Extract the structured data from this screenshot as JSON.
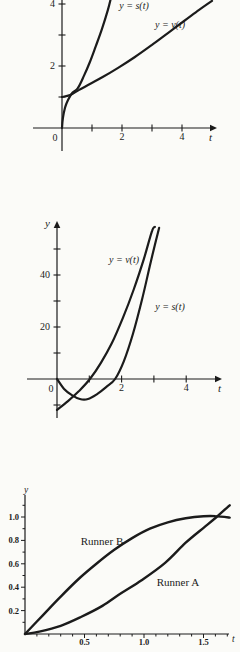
{
  "page": {
    "background": "#fbfbf8",
    "ink_color": "#1b1b1b"
  },
  "chart_data": [
    {
      "id": "top-position-velocity",
      "type": "line",
      "title": "",
      "xlabel": "t",
      "ylabel": "",
      "origin_label": "0",
      "xlim": [
        0,
        5.2
      ],
      "ylim": [
        0,
        4.3
      ],
      "grid": false,
      "legend_position": "inline-annotations",
      "x_ticks": [
        {
          "v": 1,
          "label": ""
        },
        {
          "v": 2,
          "label": "2"
        },
        {
          "v": 3,
          "label": ""
        },
        {
          "v": 4,
          "label": "4"
        }
      ],
      "y_ticks": [
        {
          "v": 1,
          "label": ""
        },
        {
          "v": 2,
          "label": "2"
        },
        {
          "v": 3,
          "label": ""
        },
        {
          "v": 4,
          "label": "4"
        }
      ],
      "series": [
        {
          "name": "y = s(t)",
          "points": [
            [
              0,
              0
            ],
            [
              0.03,
              0.32
            ],
            [
              0.1,
              0.65
            ],
            [
              0.2,
              0.9
            ],
            [
              0.34,
              1.13
            ],
            [
              0.53,
              1.29
            ],
            [
              0.73,
              1.68
            ],
            [
              0.93,
              2.13
            ],
            [
              1.13,
              2.65
            ],
            [
              1.33,
              3.19
            ],
            [
              1.53,
              3.81
            ],
            [
              1.63,
              4.19
            ]
          ]
        },
        {
          "name": "y = v(t)",
          "points": [
            [
              0,
              1.0
            ],
            [
              0.27,
              1.06
            ],
            [
              0.57,
              1.23
            ],
            [
              0.93,
              1.42
            ],
            [
              1.37,
              1.65
            ],
            [
              1.87,
              1.94
            ],
            [
              2.43,
              2.29
            ],
            [
              3.0,
              2.68
            ],
            [
              3.53,
              3.06
            ],
            [
              4.07,
              3.45
            ],
            [
              4.57,
              3.81
            ],
            [
              5.0,
              4.1
            ]
          ]
        }
      ],
      "annotations": [
        {
          "text": "y = s(t)",
          "x": 134,
          "y": 9,
          "italic": true,
          "fs": 10
        },
        {
          "text": "y = v(t)",
          "x": 170,
          "y": 28,
          "italic": true,
          "fs": 10
        }
      ]
    },
    {
      "id": "middle-position-velocity",
      "type": "line",
      "title": "",
      "xlabel": "t",
      "ylabel": "y",
      "origin_label": "0",
      "xlim": [
        0,
        5.0
      ],
      "ylim": [
        -15,
        62
      ],
      "grid": false,
      "legend_position": "inline-annotations",
      "x_ticks": [
        {
          "v": 1,
          "label": ""
        },
        {
          "v": 2,
          "label": "2"
        },
        {
          "v": 3,
          "label": ""
        },
        {
          "v": 4,
          "label": "4"
        }
      ],
      "y_ticks": [
        {
          "v": -10,
          "label": ""
        },
        {
          "v": 10,
          "label": ""
        },
        {
          "v": 20,
          "label": "20"
        },
        {
          "v": 30,
          "label": ""
        },
        {
          "v": 40,
          "label": "40"
        },
        {
          "v": 50,
          "label": ""
        }
      ],
      "series": [
        {
          "name": "y = v(t)",
          "points": [
            [
              0,
              -11.9
            ],
            [
              0.34,
              -8.5
            ],
            [
              0.68,
              -4.6
            ],
            [
              1.02,
              0
            ],
            [
              1.36,
              6.2
            ],
            [
              1.7,
              13.8
            ],
            [
              2.04,
              23.5
            ],
            [
              2.38,
              34.6
            ],
            [
              2.69,
              46.2
            ],
            [
              2.94,
              56.9
            ],
            [
              3.03,
              58.5
            ]
          ]
        },
        {
          "name": "y = s(t)",
          "points": [
            [
              0,
              0
            ],
            [
              0.22,
              -3.8
            ],
            [
              0.46,
              -6.2
            ],
            [
              0.71,
              -7.7
            ],
            [
              0.96,
              -7.7
            ],
            [
              1.24,
              -5.8
            ],
            [
              1.52,
              -3.1
            ],
            [
              1.8,
              0
            ],
            [
              2.07,
              6.9
            ],
            [
              2.35,
              17.3
            ],
            [
              2.63,
              30.4
            ],
            [
              2.91,
              45.4
            ],
            [
              3.16,
              58.1
            ]
          ]
        }
      ],
      "annotations": [
        {
          "text": "y = v(t)",
          "x": 124,
          "y": 83,
          "italic": true,
          "fs": 10
        },
        {
          "text": "y = s(t)",
          "x": 170,
          "y": 130,
          "italic": true,
          "fs": 10
        }
      ]
    },
    {
      "id": "bottom-two-runners",
      "type": "line",
      "title": "",
      "xlabel": "t",
      "ylabel": "y",
      "origin_label": "",
      "xlim": [
        0,
        1.72
      ],
      "ylim": [
        0,
        1.18
      ],
      "grid": false,
      "legend_position": "inline-annotations",
      "x_ticks": [
        {
          "v": 0.1,
          "minor": true
        },
        {
          "v": 0.2,
          "minor": true
        },
        {
          "v": 0.3,
          "minor": true
        },
        {
          "v": 0.4,
          "minor": true
        },
        {
          "v": 0.5,
          "label": "0.5"
        },
        {
          "v": 0.6,
          "minor": true
        },
        {
          "v": 0.7,
          "minor": true
        },
        {
          "v": 0.8,
          "minor": true
        },
        {
          "v": 0.9,
          "minor": true
        },
        {
          "v": 1.0,
          "label": "1.0"
        },
        {
          "v": 1.1,
          "minor": true
        },
        {
          "v": 1.2,
          "minor": true
        },
        {
          "v": 1.3,
          "minor": true
        },
        {
          "v": 1.4,
          "minor": true
        },
        {
          "v": 1.5,
          "label": "1.5"
        },
        {
          "v": 1.6,
          "minor": true
        },
        {
          "v": 1.7,
          "minor": true
        }
      ],
      "y_ticks": [
        {
          "v": 0.1,
          "minor": true
        },
        {
          "v": 0.2,
          "label": "0.2"
        },
        {
          "v": 0.3,
          "minor": true
        },
        {
          "v": 0.4,
          "label": "0.4"
        },
        {
          "v": 0.5,
          "minor": true
        },
        {
          "v": 0.6,
          "label": "0.6"
        },
        {
          "v": 0.7,
          "minor": true
        },
        {
          "v": 0.8,
          "label": "0.8"
        },
        {
          "v": 0.9,
          "minor": true
        },
        {
          "v": 1.0,
          "label": "1.0"
        },
        {
          "v": 1.1,
          "minor": true
        }
      ],
      "series": [
        {
          "name": "Runner B",
          "points": [
            [
              0,
              0
            ],
            [
              0.15,
              0.16
            ],
            [
              0.3,
              0.32
            ],
            [
              0.45,
              0.47
            ],
            [
              0.6,
              0.6
            ],
            [
              0.75,
              0.72
            ],
            [
              0.9,
              0.82
            ],
            [
              1.05,
              0.9
            ],
            [
              1.2,
              0.955
            ],
            [
              1.35,
              0.99
            ],
            [
              1.5,
              1.007
            ],
            [
              1.6,
              1.008
            ],
            [
              1.72,
              0.995
            ]
          ]
        },
        {
          "name": "Runner A",
          "points": [
            [
              0,
              0
            ],
            [
              0.12,
              0.02
            ],
            [
              0.3,
              0.07
            ],
            [
              0.47,
              0.145
            ],
            [
              0.65,
              0.24
            ],
            [
              0.81,
              0.35
            ],
            [
              0.98,
              0.46
            ],
            [
              1.18,
              0.61
            ],
            [
              1.35,
              0.78
            ],
            [
              1.51,
              0.915
            ],
            [
              1.61,
              1.0
            ],
            [
              1.72,
              1.1
            ]
          ]
        }
      ],
      "annotations": [
        {
          "text": "Runner B",
          "x": 102,
          "y": 65,
          "italic": false,
          "fs": 11
        },
        {
          "text": "Runner A",
          "x": 178,
          "y": 106,
          "italic": false,
          "fs": 11
        }
      ]
    }
  ]
}
